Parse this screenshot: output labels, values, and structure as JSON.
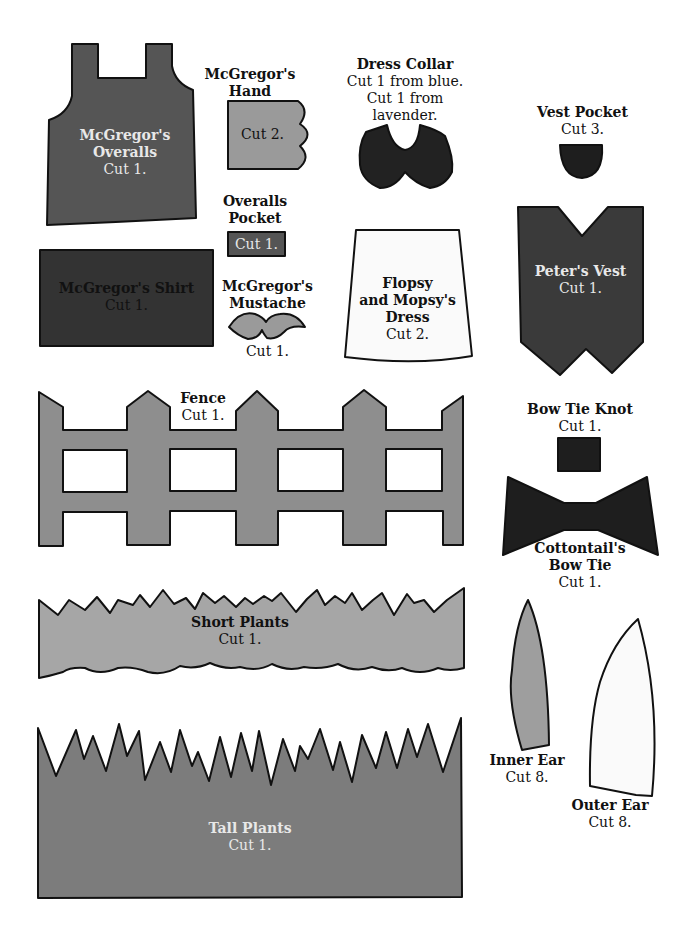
{
  "colors": {
    "outline": "#111111",
    "dark_gray": "#3e3e3e",
    "darker_gray": "#2f2f2f",
    "medium_gray": "#5c5c5c",
    "overalls_gray": "#555555",
    "light_gray": "#9a9a9a",
    "fence_gray": "#8e8e8e",
    "plants_gray": "#a6a6a6",
    "tall_plants_gray": "#7c7c7c",
    "near_black": "#1e1e1e",
    "white_piece": "#f8f8f8",
    "background": "#ffffff"
  },
  "pieces": {
    "overalls": {
      "title_line1": "McGregor's",
      "title_line2": "Overalls",
      "cut": "Cut 1."
    },
    "hand": {
      "title_line1": "McGregor's",
      "title_line2": "Hand",
      "cut": "Cut 2."
    },
    "dress_collar": {
      "title": "Dress Collar",
      "cut_line1": "Cut 1 from blue.",
      "cut_line2": "Cut 1 from",
      "cut_line3": "lavender."
    },
    "vest_pocket": {
      "title": "Vest Pocket",
      "cut": "Cut 3."
    },
    "overalls_pocket": {
      "title_line1": "Overalls",
      "title_line2": "Pocket",
      "cut": "Cut 1."
    },
    "shirt": {
      "title": "McGregor's Shirt",
      "cut": "Cut 1."
    },
    "mustache": {
      "title_line1": "McGregor's",
      "title_line2": "Mustache",
      "cut": "Cut 1."
    },
    "dress": {
      "title_line1": "Flopsy",
      "title_line2": "and Mopsy's",
      "title_line3": "Dress",
      "cut": "Cut 2."
    },
    "vest": {
      "title": "Peter's Vest",
      "cut": "Cut 1."
    },
    "fence": {
      "title": "Fence",
      "cut": "Cut 1."
    },
    "bow_tie_knot": {
      "title": "Bow Tie Knot",
      "cut": "Cut 1."
    },
    "bow_tie": {
      "title_line1": "Cottontail's",
      "title_line2": "Bow Tie",
      "cut": "Cut 1."
    },
    "short_plants": {
      "title": "Short Plants",
      "cut": "Cut 1."
    },
    "tall_plants": {
      "title": "Tall Plants",
      "cut": "Cut 1."
    },
    "inner_ear": {
      "title": "Inner Ear",
      "cut": "Cut 8."
    },
    "outer_ear": {
      "title": "Outer Ear",
      "cut": "Cut 8."
    }
  }
}
